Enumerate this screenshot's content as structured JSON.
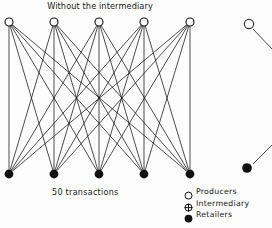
{
  "figure": {
    "title": "Without the intermediary",
    "caption": "50 transactions",
    "transaction_count": 50,
    "producer_count": 5,
    "retailer_count": 5,
    "intermediary_count": 0,
    "edge_count": 25,
    "ink_color": "#111111",
    "background_color": "#fdfdfd"
  },
  "legend": {
    "items": [
      {
        "icon": "open-circle-icon",
        "label": "Producers"
      },
      {
        "icon": "crossed-circle-icon",
        "label": "Intermediary"
      },
      {
        "icon": "filled-circle-icon",
        "label": "Retailers"
      }
    ]
  },
  "chart_data": {
    "type": "diagram",
    "title": "Without the intermediary",
    "subtitle": "50 transactions",
    "layout": "bipartite-network",
    "node_groups": [
      {
        "name": "Producers",
        "symbol": "open-circle",
        "y": 22,
        "nodes": [
          {
            "id": "P1",
            "x": 9,
            "y": 22
          },
          {
            "id": "P2",
            "x": 54,
            "y": 22
          },
          {
            "id": "P3",
            "x": 99,
            "y": 22
          },
          {
            "id": "P4",
            "x": 144,
            "y": 22
          },
          {
            "id": "P5",
            "x": 190,
            "y": 22
          }
        ]
      },
      {
        "name": "Retailers",
        "symbol": "filled-circle",
        "y": 174,
        "nodes": [
          {
            "id": "R1",
            "x": 9,
            "y": 174
          },
          {
            "id": "R2",
            "x": 54,
            "y": 174
          },
          {
            "id": "R3",
            "x": 99,
            "y": 174
          },
          {
            "id": "R4",
            "x": 144,
            "y": 174
          },
          {
            "id": "R5",
            "x": 190,
            "y": 174
          }
        ]
      }
    ],
    "edges": [
      [
        "P1",
        "R1"
      ],
      [
        "P1",
        "R2"
      ],
      [
        "P1",
        "R3"
      ],
      [
        "P1",
        "R4"
      ],
      [
        "P1",
        "R5"
      ],
      [
        "P2",
        "R1"
      ],
      [
        "P2",
        "R2"
      ],
      [
        "P2",
        "R3"
      ],
      [
        "P2",
        "R4"
      ],
      [
        "P2",
        "R5"
      ],
      [
        "P3",
        "R1"
      ],
      [
        "P3",
        "R2"
      ],
      [
        "P3",
        "R3"
      ],
      [
        "P3",
        "R4"
      ],
      [
        "P3",
        "R5"
      ],
      [
        "P4",
        "R1"
      ],
      [
        "P4",
        "R2"
      ],
      [
        "P4",
        "R3"
      ],
      [
        "P4",
        "R4"
      ],
      [
        "P4",
        "R5"
      ],
      [
        "P5",
        "R1"
      ],
      [
        "P5",
        "R2"
      ],
      [
        "P5",
        "R3"
      ],
      [
        "P5",
        "R4"
      ],
      [
        "P5",
        "R5"
      ]
    ],
    "adjacent_figure_fragment": {
      "description": "edge of the neighbouring panel cropped at right border",
      "nodes": [
        {
          "id": "P1b",
          "symbol": "open-circle",
          "x": 249,
          "y": 24
        },
        {
          "id": "R1b",
          "symbol": "filled-circle",
          "x": 247,
          "y": 168
        }
      ],
      "edges": [
        {
          "from": [
            253,
            29
          ],
          "to": [
            272,
            49
          ]
        },
        {
          "from": [
            253,
            164
          ],
          "to": [
            272,
            145
          ]
        }
      ]
    },
    "legend_position": "bottom-right",
    "grid": false
  }
}
